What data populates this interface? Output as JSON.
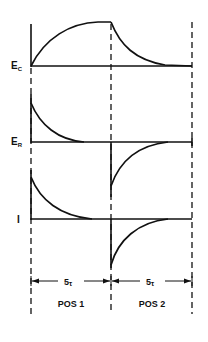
{
  "diagram": {
    "type": "rc-timing-diagram",
    "traces": [
      {
        "id": "ec",
        "label_main": "E",
        "label_sub": "C",
        "description": "capacitor voltage: charges in POS 1, discharges in POS 2"
      },
      {
        "id": "er",
        "label_main": "E",
        "label_sub": "R",
        "description": "resistor voltage: positive decay in POS 1, negative decay in POS 2"
      },
      {
        "id": "i",
        "label_main": "I",
        "label_sub": "",
        "description": "current: positive decay in POS 1, negative decay in POS 2"
      }
    ],
    "intervals": [
      {
        "id": "pos1",
        "duration_main": "5",
        "duration_sub": "τ",
        "label": "POS 1"
      },
      {
        "id": "pos2",
        "duration_main": "5",
        "duration_sub": "τ",
        "label": "POS 2"
      }
    ],
    "colors": {
      "ink": "#111111",
      "background": "#ffffff"
    }
  }
}
